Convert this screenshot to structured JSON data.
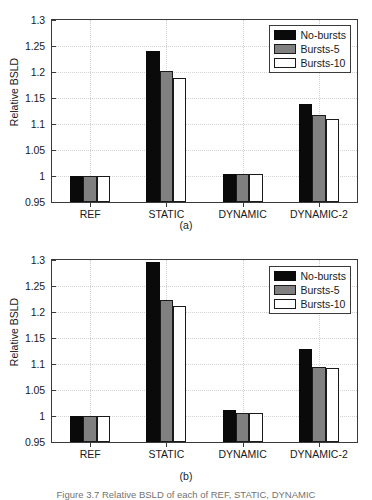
{
  "figure": {
    "caption": "Figure 3.7   Relative BSLD of each of REF, STATIC, DYNAMIC"
  },
  "panels": [
    {
      "id": "a",
      "caption": "(a)",
      "ylabel": "Relative BSLD",
      "yticks": [
        "0.95",
        "1",
        "1.05",
        "1.1",
        "1.15",
        "1.2",
        "1.25",
        "1.3"
      ],
      "categories": [
        "REF",
        "STATIC",
        "DYNAMIC",
        "DYNAMIC-2"
      ],
      "legend": [
        "No-bursts",
        "Bursts-5",
        "Bursts-10"
      ]
    },
    {
      "id": "b",
      "caption": "(b)",
      "ylabel": "Relative BSLD",
      "yticks": [
        "0.95",
        "1",
        "1.05",
        "1.1",
        "1.15",
        "1.2",
        "1.25",
        "1.3"
      ],
      "categories": [
        "REF",
        "STATIC",
        "DYNAMIC",
        "DYNAMIC-2"
      ],
      "legend": [
        "No-bursts",
        "Bursts-5",
        "Bursts-10"
      ]
    }
  ],
  "chart_data": [
    {
      "type": "bar",
      "panel": "(a)",
      "title": "",
      "xlabel": "",
      "ylabel": "Relative BSLD",
      "ylim": [
        0.95,
        1.3
      ],
      "yticks": [
        0.95,
        1.0,
        1.05,
        1.1,
        1.15,
        1.2,
        1.25,
        1.3
      ],
      "grid": true,
      "legend_position": "top-right",
      "categories": [
        "REF",
        "STATIC",
        "DYNAMIC",
        "DYNAMIC-2"
      ],
      "series": [
        {
          "name": "No-bursts",
          "color": "#0a0a0a",
          "values": [
            1.0,
            1.241,
            1.004,
            1.139
          ]
        },
        {
          "name": "Bursts-5",
          "color": "#808080",
          "values": [
            1.0,
            1.201,
            1.003,
            1.118
          ]
        },
        {
          "name": "Bursts-10",
          "color": "#ffffff",
          "values": [
            1.0,
            1.188,
            1.003,
            1.11
          ]
        }
      ]
    },
    {
      "type": "bar",
      "panel": "(b)",
      "title": "",
      "xlabel": "",
      "ylabel": "Relative BSLD",
      "ylim": [
        0.95,
        1.3
      ],
      "yticks": [
        0.95,
        1.0,
        1.05,
        1.1,
        1.15,
        1.2,
        1.25,
        1.3
      ],
      "grid": true,
      "legend_position": "top-right",
      "categories": [
        "REF",
        "STATIC",
        "DYNAMIC",
        "DYNAMIC-2"
      ],
      "series": [
        {
          "name": "No-bursts",
          "color": "#0a0a0a",
          "values": [
            1.0,
            1.297,
            1.012,
            1.128
          ]
        },
        {
          "name": "Bursts-5",
          "color": "#808080",
          "values": [
            1.0,
            1.224,
            1.006,
            1.095
          ]
        },
        {
          "name": "Bursts-10",
          "color": "#ffffff",
          "values": [
            1.0,
            1.212,
            1.006,
            1.092
          ]
        }
      ]
    }
  ]
}
